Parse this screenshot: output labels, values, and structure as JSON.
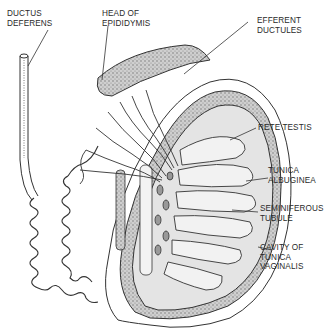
{
  "diagram": {
    "labels": [
      {
        "id": "ductus-deferens",
        "text": "DUCTUS\nDEFERENS"
      },
      {
        "id": "head-of-epididymis",
        "text": "HEAD OF\nEPIDIDYMIS"
      },
      {
        "id": "efferent-ductules",
        "text": "EFFERENT\nDUCTULES"
      },
      {
        "id": "rete-testis",
        "text": "RETE TESTIS"
      },
      {
        "id": "tunica-albuginea",
        "text": "TUNICA\nALBUGINEA"
      },
      {
        "id": "seminiferous-tubule",
        "text": "SEMINIFEROUS\nTUBULE"
      },
      {
        "id": "cavity-of-tunica-vaginalis",
        "text": "CAVITY OF\nTUNICA\nVAGINALIS"
      }
    ],
    "colors": {
      "line": "#333333",
      "stipple": "#9a9a9a",
      "interior": "#e4e4e4",
      "background": "#ffffff"
    }
  }
}
